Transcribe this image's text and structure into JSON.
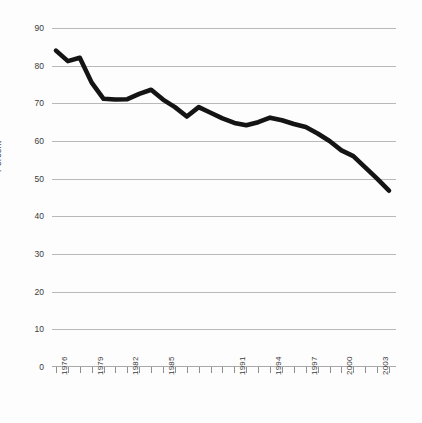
{
  "chart_data": {
    "type": "line",
    "title": "",
    "subtitle": "",
    "xlabel": "",
    "ylabel": "Percent",
    "ylim": [
      0,
      90
    ],
    "xlim": [
      1976,
      2004
    ],
    "grid": true,
    "legend": null,
    "y_ticks": [
      90,
      80,
      70,
      60,
      50,
      40,
      30,
      20,
      10,
      0
    ],
    "y_tick_labels": [
      "90",
      "80",
      "70",
      "60",
      "50",
      "40",
      "30",
      "20",
      "10",
      "0"
    ],
    "x_tick_values": [
      1976,
      1977,
      1978,
      1979,
      1980,
      1981,
      1982,
      1983,
      1984,
      1985,
      1986,
      1987,
      1988,
      1989,
      1990,
      1991,
      1992,
      1993,
      1994,
      1995,
      1996,
      1997,
      1998,
      1999,
      2000,
      2001,
      2002,
      2003,
      2004
    ],
    "x_tick_labels": [
      "1976",
      "",
      "",
      "1979",
      "",
      "",
      "1982",
      "",
      "",
      "1985",
      "",
      "",
      "",
      "",
      "",
      "1991",
      "",
      "",
      "1994",
      "",
      "",
      "1997",
      "",
      "",
      "2000",
      "",
      "",
      "2003",
      ""
    ],
    "series": [
      {
        "name": "Percent",
        "color": "#141414",
        "x": [
          1976,
          1977,
          1978,
          1979,
          1980,
          1981,
          1982,
          1983,
          1984,
          1985,
          1986,
          1987,
          1988,
          1989,
          1990,
          1991,
          1992,
          1993,
          1994,
          1995,
          1996,
          1997,
          1998,
          1999,
          2000,
          2001,
          2002,
          2003,
          2004
        ],
        "values": [
          84.0,
          81.2,
          82.1,
          75.5,
          71.2,
          71.0,
          71.1,
          72.5,
          73.6,
          71.0,
          69.0,
          66.5,
          69.0,
          67.5,
          66.0,
          64.8,
          64.2,
          65.0,
          66.2,
          65.5,
          64.5,
          63.7,
          62.0,
          60.0,
          57.5,
          56.0,
          53.0,
          50.0,
          46.8
        ]
      }
    ]
  }
}
